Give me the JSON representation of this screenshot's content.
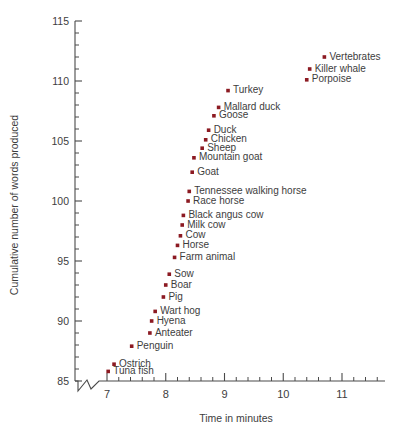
{
  "chart_data": {
    "type": "scatter",
    "title": "",
    "xlabel": "Time in minutes",
    "ylabel": "Cumulative number of words produced",
    "xlim": [
      6.62,
      11.9
    ],
    "ylim": [
      85,
      115
    ],
    "xticks": [
      7,
      8,
      9,
      10,
      11
    ],
    "xtick_labels": [
      "7",
      "8",
      "9",
      "10",
      "11"
    ],
    "yticks": [
      85,
      90,
      95,
      100,
      105,
      110,
      115
    ],
    "ytick_labels": [
      "85",
      "90",
      "95",
      "100",
      "105",
      "110",
      "115"
    ],
    "x_minor_step": 0.2,
    "y_minor_step": 1,
    "grid": false,
    "legend": false,
    "axis_break_x": true,
    "marker_color": "#8c1a22",
    "points": [
      {
        "label": "Vertebrates",
        "x": 10.7,
        "y": 112.0
      },
      {
        "label": "Killer whale",
        "x": 10.45,
        "y": 111.0
      },
      {
        "label": "Porpoise",
        "x": 10.4,
        "y": 110.1
      },
      {
        "label": "Turkey",
        "x": 9.06,
        "y": 109.2
      },
      {
        "label": "Mallard duck",
        "x": 8.9,
        "y": 107.8
      },
      {
        "label": "Goose",
        "x": 8.82,
        "y": 107.1
      },
      {
        "label": "Duck",
        "x": 8.73,
        "y": 105.9
      },
      {
        "label": "Chicken",
        "x": 8.68,
        "y": 105.1
      },
      {
        "label": "Sheep",
        "x": 8.62,
        "y": 104.4
      },
      {
        "label": "Mountain goat",
        "x": 8.48,
        "y": 103.6
      },
      {
        "label": "Goat",
        "x": 8.45,
        "y": 102.4
      },
      {
        "label": "Tennessee walking horse",
        "x": 8.4,
        "y": 100.8
      },
      {
        "label": "Race horse",
        "x": 8.38,
        "y": 100.0
      },
      {
        "label": "Black angus cow",
        "x": 8.3,
        "y": 98.8
      },
      {
        "label": "Milk cow",
        "x": 8.28,
        "y": 98.0
      },
      {
        "label": "Cow",
        "x": 8.25,
        "y": 97.1
      },
      {
        "label": "Horse",
        "x": 8.2,
        "y": 96.3
      },
      {
        "label": "Farm animal",
        "x": 8.15,
        "y": 95.3
      },
      {
        "label": "Sow",
        "x": 8.06,
        "y": 93.9
      },
      {
        "label": "Boar",
        "x": 8.0,
        "y": 93.0
      },
      {
        "label": "Pig",
        "x": 7.96,
        "y": 92.0
      },
      {
        "label": "Wart hog",
        "x": 7.82,
        "y": 90.8
      },
      {
        "label": "Hyena",
        "x": 7.76,
        "y": 90.0
      },
      {
        "label": "Anteater",
        "x": 7.73,
        "y": 89.0
      },
      {
        "label": "Penguin",
        "x": 7.42,
        "y": 87.9
      },
      {
        "label": "Ostrich",
        "x": 7.12,
        "y": 86.4
      },
      {
        "label": "Tuna fish",
        "x": 7.02,
        "y": 85.8
      }
    ]
  }
}
